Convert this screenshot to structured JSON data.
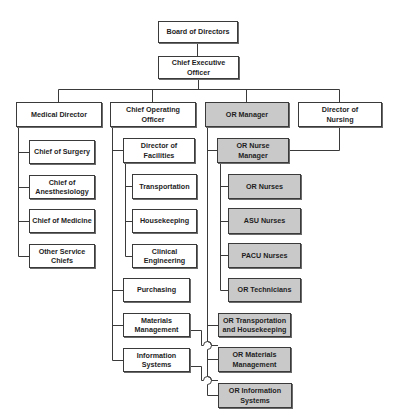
{
  "diagram": {
    "type": "org-chart",
    "colors": {
      "box_fill": "#ffffff",
      "or_box_fill": "#c9c9c9",
      "border": "#3a3a3a",
      "line": "#3a3a3a",
      "text": "#1e1e1e"
    },
    "nodes": {
      "board": {
        "label": "Board of Directors"
      },
      "ceo": {
        "label": "Chief Executive\nOfficer"
      },
      "medical_director": {
        "label": "Medical Director"
      },
      "coo": {
        "label": "Chief Operating\nOfficer"
      },
      "or_manager": {
        "label": "OR Manager"
      },
      "director_nursing": {
        "label": "Director of\nNursing"
      },
      "chief_surgery": {
        "label": "Chief of Surgery"
      },
      "chief_anesthesiology": {
        "label": "Chief of\nAnesthesiology"
      },
      "chief_medicine": {
        "label": "Chief of Medicine"
      },
      "other_chiefs": {
        "label": "Other Service\nChiefs"
      },
      "director_facilities": {
        "label": "Director of\nFacilities"
      },
      "transportation": {
        "label": "Transportation"
      },
      "housekeeping": {
        "label": "Housekeeping"
      },
      "clinical_engineering": {
        "label": "Clinical\nEngineering"
      },
      "purchasing": {
        "label": "Purchasing"
      },
      "materials_management": {
        "label": "Materials\nManagement"
      },
      "information_systems": {
        "label": "Information\nSystems"
      },
      "or_nurse_manager": {
        "label": "OR Nurse\nManager"
      },
      "or_nurses": {
        "label": "OR Nurses"
      },
      "asu_nurses": {
        "label": "ASU Nurses"
      },
      "pacu_nurses": {
        "label": "PACU Nurses"
      },
      "or_technicians": {
        "label": "OR Technicians"
      },
      "or_transport_housekeeping": {
        "label": "OR Transportation\nand Housekeeping"
      },
      "or_materials_management": {
        "label": "OR Materials\nManagement"
      },
      "or_information_systems": {
        "label": "OR Information\nSystems"
      }
    },
    "edges": [
      [
        "board",
        "ceo"
      ],
      [
        "ceo",
        "medical_director"
      ],
      [
        "ceo",
        "coo"
      ],
      [
        "ceo",
        "or_manager"
      ],
      [
        "ceo",
        "director_nursing"
      ],
      [
        "medical_director",
        "chief_surgery"
      ],
      [
        "medical_director",
        "chief_anesthesiology"
      ],
      [
        "medical_director",
        "chief_medicine"
      ],
      [
        "medical_director",
        "other_chiefs"
      ],
      [
        "coo",
        "director_facilities"
      ],
      [
        "director_facilities",
        "transportation"
      ],
      [
        "director_facilities",
        "housekeeping"
      ],
      [
        "director_facilities",
        "clinical_engineering"
      ],
      [
        "coo",
        "purchasing"
      ],
      [
        "coo",
        "materials_management"
      ],
      [
        "coo",
        "information_systems"
      ],
      [
        "or_manager",
        "or_nurse_manager"
      ],
      [
        "director_nursing",
        "or_nurse_manager"
      ],
      [
        "or_nurse_manager",
        "or_nurses"
      ],
      [
        "or_nurse_manager",
        "asu_nurses"
      ],
      [
        "or_nurse_manager",
        "pacu_nurses"
      ],
      [
        "or_nurse_manager",
        "or_technicians"
      ],
      [
        "or_manager",
        "or_transport_housekeeping"
      ],
      [
        "or_manager",
        "or_materials_management"
      ],
      [
        "or_manager",
        "or_information_systems"
      ],
      [
        "materials_management",
        "or_materials_management"
      ],
      [
        "information_systems",
        "or_information_systems"
      ]
    ]
  }
}
